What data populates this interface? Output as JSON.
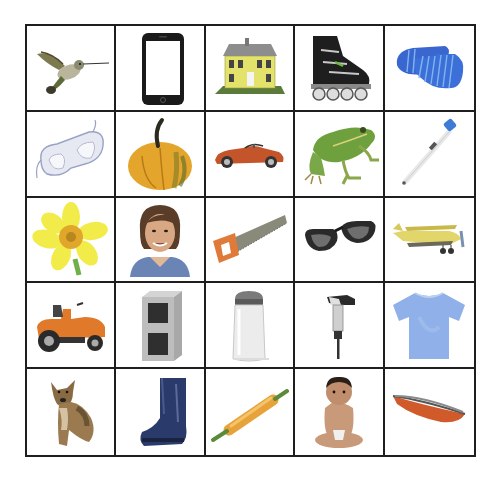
{
  "board": {
    "title": "Picture grid",
    "rows": 5,
    "columns": 5,
    "grid_color": "#1e1e1e",
    "cells": [
      {
        "row": 1,
        "col": 1,
        "label": "Hummingbird",
        "icon": "hummingbird-icon"
      },
      {
        "row": 1,
        "col": 2,
        "label": "Smartphone",
        "icon": "smartphone-icon"
      },
      {
        "row": 1,
        "col": 3,
        "label": "House",
        "icon": "house-icon"
      },
      {
        "row": 1,
        "col": 4,
        "label": "Inline skate",
        "icon": "inline-skate-icon"
      },
      {
        "row": 1,
        "col": 5,
        "label": "Socks",
        "icon": "socks-icon"
      },
      {
        "row": 2,
        "col": 1,
        "label": "Safety goggles",
        "icon": "goggles-icon"
      },
      {
        "row": 2,
        "col": 2,
        "label": "Squash",
        "icon": "squash-icon"
      },
      {
        "row": 2,
        "col": 3,
        "label": "Sports car",
        "icon": "car-icon"
      },
      {
        "row": 2,
        "col": 4,
        "label": "Frog",
        "icon": "frog-icon"
      },
      {
        "row": 2,
        "col": 5,
        "label": "Thermometer",
        "icon": "thermometer-icon"
      },
      {
        "row": 3,
        "col": 1,
        "label": "Daffodil",
        "icon": "daffodil-icon"
      },
      {
        "row": 3,
        "col": 2,
        "label": "Woman",
        "icon": "woman-icon"
      },
      {
        "row": 3,
        "col": 3,
        "label": "Saw",
        "icon": "saw-icon"
      },
      {
        "row": 3,
        "col": 4,
        "label": "Sunglasses",
        "icon": "sunglasses-icon"
      },
      {
        "row": 3,
        "col": 5,
        "label": "Airplane",
        "icon": "airplane-icon"
      },
      {
        "row": 4,
        "col": 1,
        "label": "Riding lawn mower",
        "icon": "lawn-mower-icon"
      },
      {
        "row": 4,
        "col": 2,
        "label": "Cinder block",
        "icon": "cinder-block-icon"
      },
      {
        "row": 4,
        "col": 3,
        "label": "Salt shaker",
        "icon": "salt-shaker-icon"
      },
      {
        "row": 4,
        "col": 4,
        "label": "Jackhammer",
        "icon": "jackhammer-icon"
      },
      {
        "row": 4,
        "col": 5,
        "label": "T-shirt",
        "icon": "tshirt-icon"
      },
      {
        "row": 5,
        "col": 1,
        "label": "Dog",
        "icon": "dog-icon"
      },
      {
        "row": 5,
        "col": 2,
        "label": "Rain boot",
        "icon": "boot-icon"
      },
      {
        "row": 5,
        "col": 3,
        "label": "Rolling pin",
        "icon": "rolling-pin-icon"
      },
      {
        "row": 5,
        "col": 4,
        "label": "Baby",
        "icon": "baby-icon"
      },
      {
        "row": 5,
        "col": 5,
        "label": "Canoe",
        "icon": "canoe-icon"
      }
    ]
  }
}
